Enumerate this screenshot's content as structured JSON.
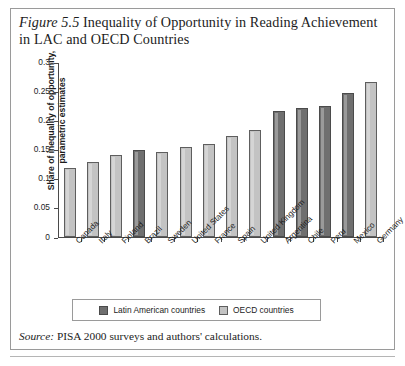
{
  "figure": {
    "label": "Figure 5.5",
    "title": "Inequality of Opportunity in Reading Achievement in LAC and OECD Countries",
    "title_line1": "Inequality of Opportunity in Reading Achievement",
    "title_line2": "in LAC and OECD Countries"
  },
  "source": {
    "label": "Source:",
    "text": "PISA 2000 surveys and authors' calculations."
  },
  "legend": {
    "items": [
      {
        "label": "Latin American countries",
        "group": "lac",
        "color": "#6f6f6f"
      },
      {
        "label": "OECD countries",
        "group": "oecd",
        "color": "#c3c3c3"
      }
    ]
  },
  "chart_data": {
    "type": "bar",
    "title": "Inequality of Opportunity in Reading Achievement in LAC and OECD Countries",
    "xlabel": "",
    "ylabel": "Share of inequality of opportunity, parametric estimates",
    "ylabel_line1": "Share of inequality of opportunity,",
    "ylabel_line2": "parametric estimates",
    "ylim": [
      0,
      0.3
    ],
    "yticks": [
      0,
      0.05,
      0.1,
      0.15,
      0.2,
      0.25,
      0.3
    ],
    "ytick_labels": [
      "0",
      "0.05",
      "0.1",
      "0.15",
      "0.2",
      "0.25",
      "0.3"
    ],
    "grid": false,
    "legend_position": "bottom",
    "categories": [
      "Canada",
      "Italy",
      "Finland",
      "Brazil",
      "Sweden",
      "United States",
      "France",
      "Spain",
      "United Kingdom",
      "Argentina",
      "Chile",
      "Peru",
      "Mexico",
      "Germany"
    ],
    "values": [
      0.119,
      0.128,
      0.14,
      0.149,
      0.146,
      0.155,
      0.16,
      0.174,
      0.184,
      0.216,
      0.222,
      0.225,
      0.247,
      0.265
    ],
    "groups": [
      "oecd",
      "oecd",
      "oecd",
      "lac",
      "oecd",
      "oecd",
      "oecd",
      "oecd",
      "oecd",
      "lac",
      "lac",
      "lac",
      "lac",
      "oecd"
    ],
    "series": [
      {
        "name": "Share of inequality of opportunity, parametric estimates",
        "values": [
          0.119,
          0.128,
          0.14,
          0.149,
          0.146,
          0.155,
          0.16,
          0.174,
          0.184,
          0.216,
          0.222,
          0.225,
          0.247,
          0.265
        ]
      }
    ],
    "colors": {
      "lac": "#6f6f6f",
      "oecd": "#c3c3c3"
    }
  }
}
